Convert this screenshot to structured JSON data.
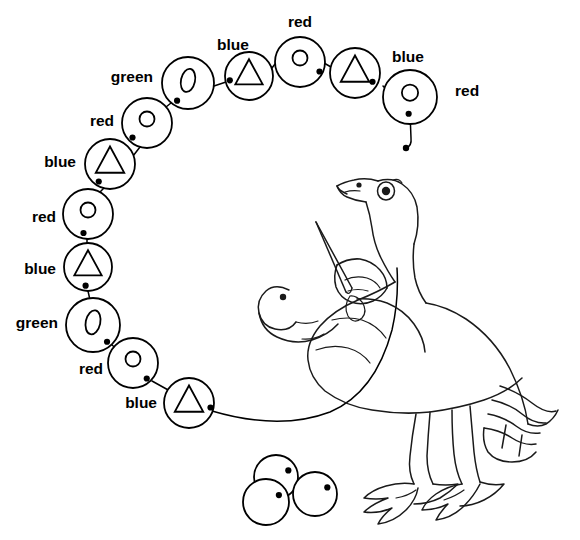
{
  "page": {
    "background_color": "#ffffff",
    "ink_color": "#000000",
    "width": 580,
    "height": 540
  },
  "labels": {
    "red": "red",
    "blue": "blue",
    "green": "green"
  },
  "illustration": {
    "subject_name": "goose-stringing-beads",
    "description": "Line-art goose holding a needle and threading a string of beads"
  },
  "bead_chain": {
    "shape_legend": {
      "red": "small-circle",
      "blue": "triangle",
      "green": "oval"
    },
    "sequence": [
      "red",
      "blue",
      "green",
      "red",
      "blue",
      "red",
      "blue",
      "green",
      "red",
      "blue",
      "red",
      "blue"
    ],
    "beads": [
      {
        "id": "bead-1",
        "color": "red",
        "shape": "small-circle",
        "label": "red",
        "cx": 410,
        "cy": 97,
        "r": 27,
        "label_x": 455,
        "label_y": 92,
        "label_anchor": "start"
      },
      {
        "id": "bead-2",
        "color": "blue",
        "shape": "triangle",
        "label": "blue",
        "cx": 355,
        "cy": 73,
        "r": 25,
        "label_x": 392,
        "label_y": 58,
        "label_anchor": "start"
      },
      {
        "id": "bead-3",
        "color": "red",
        "shape": "small-circle",
        "label": "red",
        "cx": 300,
        "cy": 62,
        "r": 25,
        "label_x": 300,
        "label_y": 23,
        "label_anchor": "middle"
      },
      {
        "id": "bead-4",
        "color": "blue",
        "shape": "triangle",
        "label": "blue",
        "cx": 249,
        "cy": 76,
        "r": 24,
        "label_x": 233,
        "label_y": 46,
        "label_anchor": "middle"
      },
      {
        "id": "bead-5",
        "color": "green",
        "shape": "oval",
        "label": "green",
        "cx": 188,
        "cy": 83,
        "r": 26,
        "label_x": 153,
        "label_y": 78,
        "label_anchor": "end"
      },
      {
        "id": "bead-6",
        "color": "red",
        "shape": "small-circle",
        "label": "red",
        "cx": 147,
        "cy": 123,
        "r": 25,
        "label_x": 114,
        "label_y": 122,
        "label_anchor": "end"
      },
      {
        "id": "bead-7",
        "color": "blue",
        "shape": "triangle",
        "label": "blue",
        "cx": 110,
        "cy": 164,
        "r": 25,
        "label_x": 76,
        "label_y": 163,
        "label_anchor": "end"
      },
      {
        "id": "bead-8",
        "color": "red",
        "shape": "small-circle",
        "label": "red",
        "cx": 88,
        "cy": 214,
        "r": 25,
        "label_x": 56,
        "label_y": 218,
        "label_anchor": "end"
      },
      {
        "id": "bead-9",
        "color": "blue",
        "shape": "triangle",
        "label": "blue",
        "cx": 88,
        "cy": 267,
        "r": 24,
        "label_x": 56,
        "label_y": 270,
        "label_anchor": "end"
      },
      {
        "id": "bead-10",
        "color": "green",
        "shape": "oval",
        "label": "green",
        "cx": 93,
        "cy": 325,
        "r": 27,
        "label_x": 58,
        "label_y": 324,
        "label_anchor": "end"
      },
      {
        "id": "bead-11",
        "color": "red",
        "shape": "small-circle",
        "label": "red",
        "cx": 133,
        "cy": 363,
        "r": 25,
        "label_x": 103,
        "label_y": 370,
        "label_anchor": "end"
      },
      {
        "id": "bead-12",
        "color": "blue",
        "shape": "triangle",
        "label": "blue",
        "cx": 189,
        "cy": 403,
        "r": 25,
        "label_x": 157,
        "label_y": 404,
        "label_anchor": "end"
      }
    ],
    "loose_beads": [
      {
        "id": "loose-bead-1",
        "cx": 276,
        "cy": 477,
        "r": 22
      },
      {
        "id": "loose-bead-2",
        "cx": 266,
        "cy": 502,
        "r": 23
      },
      {
        "id": "loose-bead-3",
        "cx": 315,
        "cy": 494,
        "r": 22
      }
    ]
  }
}
